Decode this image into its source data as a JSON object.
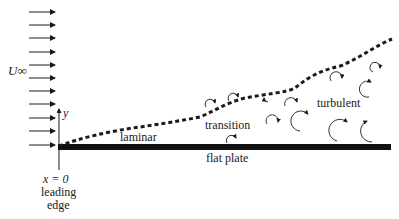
{
  "diagram": {
    "free_stream_label": "U∞",
    "y_axis_label": "y",
    "regions": {
      "laminar": "laminar",
      "transition": "transition",
      "turbulent": "turbulent"
    },
    "plate_label": "flat plate",
    "origin": {
      "coord": "x = 0",
      "line1": "leading",
      "line2": "edge"
    },
    "colors": {
      "ink": "#1a1a1a",
      "plate": "#111111",
      "background": "#ffffff"
    },
    "free_stream_arrow_count": 8
  }
}
